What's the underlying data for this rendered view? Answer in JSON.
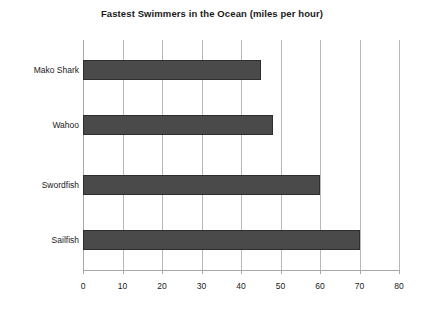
{
  "chart_data": {
    "type": "bar",
    "orientation": "horizontal",
    "title": "Fastest Swimmers in the Ocean (miles per hour)",
    "xlabel": "",
    "ylabel": "",
    "categories": [
      "Mako Shark",
      "Wahoo",
      "Swordfish",
      "Sailfish"
    ],
    "values": [
      45,
      48,
      60,
      70
    ],
    "xlim": [
      0,
      80
    ],
    "xticks": [
      0,
      10,
      20,
      30,
      40,
      50,
      60,
      70,
      80
    ],
    "xtick_labels": [
      "0",
      "10",
      "20",
      "30",
      "40",
      "50",
      "60",
      "70",
      "80"
    ],
    "grid": "vertical",
    "legend": "none",
    "bar_color": "#4a4a4a",
    "bar_edge_color": "#2e2e2e",
    "gridline_color": "#b8b8b8",
    "axis_color": "#a8a8a8",
    "text_color": "#1a1a1a"
  }
}
